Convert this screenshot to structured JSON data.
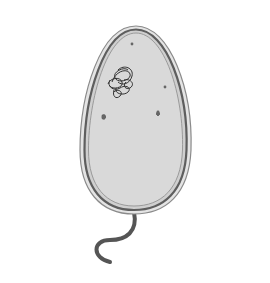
{
  "diagram": {
    "labels": {
      "cell_membrane": "cell membrane",
      "dna": "DNA",
      "cytoplasm": "cytoplasm",
      "cell_wall": "cell wall",
      "mesosome": [
        "mesosome",
        "(site of",
        "aerobic",
        "respiration)"
      ],
      "slime_coat": [
        "slime coat",
        "in some",
        "bacteria"
      ],
      "ribosome": "70S ribosome",
      "plasmid": "plasmid",
      "flagellum": [
        "flagellum in",
        "some bacteria"
      ]
    },
    "colors": {
      "cytoplasm_fill": "#d9d9d9",
      "wall": "#6e6e6e",
      "slime_coat": "#c8c8c8",
      "leader_line": "#555555",
      "text": "#2a2a2a"
    }
  }
}
